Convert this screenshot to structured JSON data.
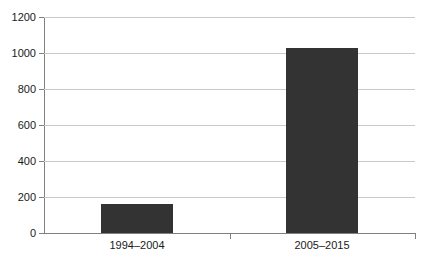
{
  "chart_data": {
    "type": "bar",
    "title": "",
    "subtitle": "",
    "xlabel": "",
    "ylabel": "",
    "categories": [
      "1994–2004",
      "2005–2015"
    ],
    "values": [
      160,
      1025
    ],
    "series": [
      {
        "name": "",
        "values": [
          160,
          1025
        ]
      }
    ],
    "ylim": [
      0,
      1200
    ],
    "ytick_labels": [
      "0",
      "200",
      "400",
      "600",
      "800",
      "1000",
      "1200"
    ],
    "ytick_values": [
      0,
      200,
      400,
      600,
      800,
      1000,
      1200
    ],
    "grid": true,
    "legend": false,
    "legend_position": "none",
    "bar_color": "#333333",
    "gridline_color": "#c9c9c9",
    "axis_color": "#808080",
    "text_color": "#1a1a1a",
    "background": "#ffffff",
    "annotations": []
  }
}
